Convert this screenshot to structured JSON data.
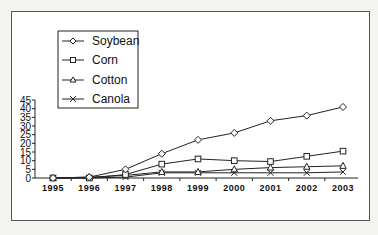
{
  "chart_data": {
    "type": "line",
    "title": "",
    "xlabel": "",
    "ylabel": "",
    "x": [
      "1995",
      "1996",
      "1997",
      "1998",
      "1999",
      "2000",
      "2001",
      "2002",
      "2003"
    ],
    "yticks": [
      "0",
      "5",
      "10",
      "15",
      "20",
      "25",
      "30",
      "35",
      "40",
      "45"
    ],
    "ylim": [
      0,
      45
    ],
    "grid": false,
    "legend_position": "upper-left",
    "series": [
      {
        "name": "Soybean",
        "marker": "diamond",
        "values": [
          0,
          0.5,
          5,
          14,
          22,
          26,
          33,
          36,
          41
        ]
      },
      {
        "name": "Corn",
        "marker": "square",
        "values": [
          0,
          0,
          2,
          8,
          11,
          10,
          9.5,
          12.5,
          15.5
        ]
      },
      {
        "name": "Cotton",
        "marker": "triangle",
        "values": [
          0,
          0.5,
          1.5,
          3.5,
          3.5,
          5,
          6,
          6.5,
          7
        ]
      },
      {
        "name": "Canola",
        "marker": "x",
        "values": [
          0,
          0,
          0.5,
          3,
          3,
          3,
          3,
          3,
          3.5
        ]
      }
    ]
  },
  "legend": {
    "items": [
      {
        "label": "Soybean",
        "marker": "diamond-icon"
      },
      {
        "label": "Corn",
        "marker": "square-icon"
      },
      {
        "label": "Cotton",
        "marker": "triangle-icon"
      },
      {
        "label": "Canola",
        "marker": "x-icon"
      }
    ]
  }
}
